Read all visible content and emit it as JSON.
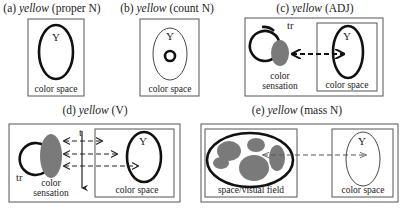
{
  "figure": {
    "panels": [
      {
        "id": "a",
        "label": "(a)",
        "word": "yellow",
        "category": "(proper N)",
        "inner_labels": {
          "y": "Y",
          "space": "color space"
        }
      },
      {
        "id": "b",
        "label": "(b)",
        "word": "yellow",
        "category": "(count N)",
        "inner_labels": {
          "y": "Y",
          "space": "color space"
        }
      },
      {
        "id": "c",
        "label": "(c)",
        "word": "yellow",
        "category": "(ADJ)",
        "inner_labels": {
          "y": "Y",
          "space": "color space",
          "tr": "tr",
          "sensation_line1": "color",
          "sensation_line2": "sensation"
        }
      },
      {
        "id": "d",
        "label": "(d)",
        "word": "yellow",
        "category": "(V)",
        "inner_labels": {
          "y": "Y",
          "space": "color space",
          "tr": "tr",
          "t": "t",
          "sensation_line1": "color",
          "sensation_line2": "sensation"
        }
      },
      {
        "id": "e",
        "label": "(e)",
        "word": "yellow",
        "category": "(mass N)",
        "inner_labels": {
          "y": "Y",
          "space": "color space",
          "field": "space/visual field"
        }
      }
    ],
    "colors": {
      "outline": "#111111",
      "box_border": "#555555",
      "sensation_fill": "#7a7a7a",
      "background": "#ffffff"
    }
  }
}
